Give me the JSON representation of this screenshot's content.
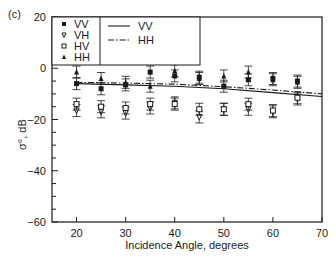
{
  "panel_label": "(c)",
  "chart_data": {
    "type": "scatter",
    "title": "",
    "xlabel": "Incidence Angle, degrees",
    "ylabel": "σ°, dB",
    "xlim": [
      15,
      70
    ],
    "ylim": [
      -60,
      20
    ],
    "xticks": [
      20,
      30,
      40,
      50,
      60,
      70
    ],
    "yticks": [
      20,
      0,
      -20,
      -40,
      -60
    ],
    "yminor_step": 5,
    "grid": false,
    "legend_position": "upper-left",
    "series": [
      {
        "name": "VV",
        "kind": "points",
        "marker": "square-filled",
        "x": [
          20,
          25,
          30,
          35,
          40,
          45,
          50,
          55,
          60,
          65
        ],
        "y": [
          -6,
          -8,
          -6.5,
          -1.5,
          -3,
          -3.5,
          -7,
          -4.5,
          -4,
          -5
        ]
      },
      {
        "name": "VH",
        "kind": "points",
        "marker": "triangle-down-open",
        "x": [
          20,
          25,
          30,
          35,
          40,
          45,
          50,
          55,
          60,
          65
        ],
        "y": [
          -16.5,
          -17,
          -17.5,
          -15.5,
          -13.5,
          -19,
          -16,
          -16,
          -17,
          -12
        ]
      },
      {
        "name": "HV",
        "kind": "points",
        "marker": "square-open",
        "x": [
          20,
          25,
          30,
          35,
          40,
          45,
          50,
          55,
          60,
          65
        ],
        "y": [
          -14,
          -15,
          -15.5,
          -14,
          -14,
          -16,
          -16,
          -14,
          -16.5,
          -11.5
        ]
      },
      {
        "name": "HH",
        "kind": "points",
        "marker": "triangle-up-filled",
        "x": [
          20,
          25,
          30,
          35,
          40,
          45,
          50,
          55,
          60,
          65
        ],
        "y": [
          -1.5,
          -4,
          -5.5,
          -7,
          -1,
          -4,
          -3,
          -1.5,
          -4.5,
          -5.5
        ]
      },
      {
        "name": "VV",
        "kind": "line",
        "style": "solid",
        "x": [
          20,
          30,
          40,
          50,
          60,
          70
        ],
        "y": [
          -6,
          -6.5,
          -7,
          -8,
          -9.5,
          -11
        ]
      },
      {
        "name": "HH",
        "kind": "line",
        "style": "dash-dot",
        "x": [
          20,
          30,
          40,
          50,
          60,
          70
        ],
        "y": [
          -5.5,
          -5.8,
          -6.2,
          -7.2,
          -8.5,
          -10
        ]
      }
    ],
    "legend": {
      "markers": [
        {
          "label": "VV",
          "marker": "square-filled"
        },
        {
          "label": "VH",
          "marker": "triangle-down-open"
        },
        {
          "label": "HV",
          "marker": "square-open"
        },
        {
          "label": "HH",
          "marker": "triangle-up-filled"
        }
      ],
      "lines": [
        {
          "label": "VV",
          "style": "solid"
        },
        {
          "label": "HH",
          "style": "dash-dot"
        }
      ]
    }
  },
  "colors": {
    "ink": "#1a1a1a",
    "background": "#ffffff"
  }
}
